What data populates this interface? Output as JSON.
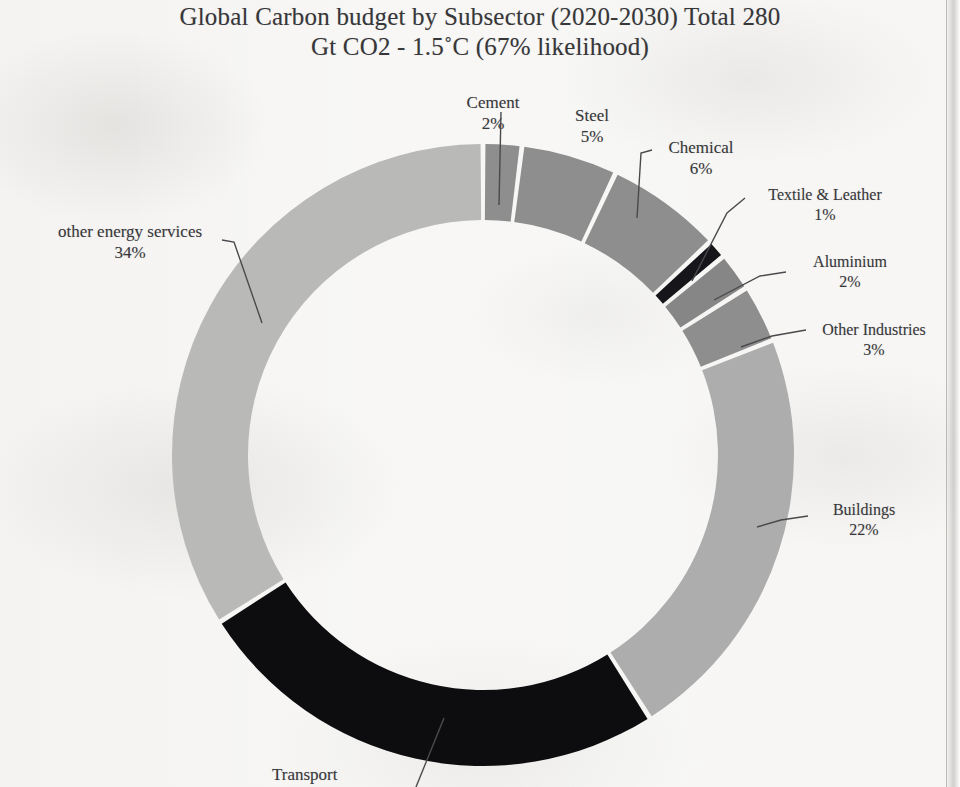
{
  "title": {
    "line1": "Global Carbon budget by Subsector (2020-2030) Total 280",
    "line2": "Gt CO2 - 1.5˚C (67% likelihood)"
  },
  "chart_data": {
    "type": "pie",
    "variant": "donut",
    "title": "Global Carbon budget by Subsector (2020-2030) Total 280 Gt CO2 - 1.5˚C (67% likelihood)",
    "total_label": "Total 280 Gt CO2",
    "unit": "%",
    "grid": false,
    "legend": "none",
    "labels_position": "outside-with-leader-lines",
    "start_angle_deg": -90,
    "direction": "clockwise",
    "categories": [
      "Cement",
      "Steel",
      "Chemical",
      "Textile & Leather",
      "Aluminium",
      "Other Industries",
      "Buildings",
      "Transport",
      "other energy services"
    ],
    "values": [
      2,
      5,
      6,
      1,
      2,
      3,
      22,
      25,
      34
    ],
    "slices": [
      {
        "label": "Cement",
        "pct": 2,
        "pct_text": "2%",
        "color": "#8e8e8e"
      },
      {
        "label": "Steel",
        "pct": 5,
        "pct_text": "5%",
        "color": "#8e8e8e"
      },
      {
        "label": "Chemical",
        "pct": 6,
        "pct_text": "6%",
        "color": "#8e8e8e"
      },
      {
        "label": "Textile & Leather",
        "pct": 1,
        "pct_text": "1%",
        "color": "#16161a"
      },
      {
        "label": "Aluminium",
        "pct": 2,
        "pct_text": "2%",
        "color": "#868686"
      },
      {
        "label": "Other Industries",
        "pct": 3,
        "pct_text": "3%",
        "color": "#8e8e8e"
      },
      {
        "label": "Buildings",
        "pct": 22,
        "pct_text": "22%",
        "color": "#adadad"
      },
      {
        "label": "Transport",
        "pct": 25,
        "pct_text": "25%",
        "color": "#0d0d0f"
      },
      {
        "label": "other energy services",
        "pct": 34,
        "pct_text": "34%",
        "color": "#b9b9b7"
      }
    ]
  },
  "labels": {
    "cement": {
      "name": "Cement",
      "pct": "2%"
    },
    "steel": {
      "name": "Steel",
      "pct": "5%"
    },
    "chemical": {
      "name": "Chemical",
      "pct": "6%"
    },
    "textile": {
      "name": "Textile  & Leather",
      "pct": "1%"
    },
    "aluminium": {
      "name": "Aluminium",
      "pct": "2%"
    },
    "other_ind": {
      "name": "Other Industries",
      "pct": "3%"
    },
    "buildings": {
      "name": "Buildings",
      "pct": "22%"
    },
    "transport": {
      "name": "Transport",
      "pct": ""
    },
    "other_energy": {
      "name": "other energy services",
      "pct": "34%"
    }
  },
  "colors": {
    "light_gray": "#b9b9b7",
    "mid_light_gray": "#adadad",
    "mid_gray": "#8e8e8e",
    "dark_gray": "#868686",
    "black": "#0d0d0f",
    "near_black": "#16161a",
    "gap": "#f4f3f1",
    "text": "#38383b",
    "paper": "#f4f3f1"
  }
}
